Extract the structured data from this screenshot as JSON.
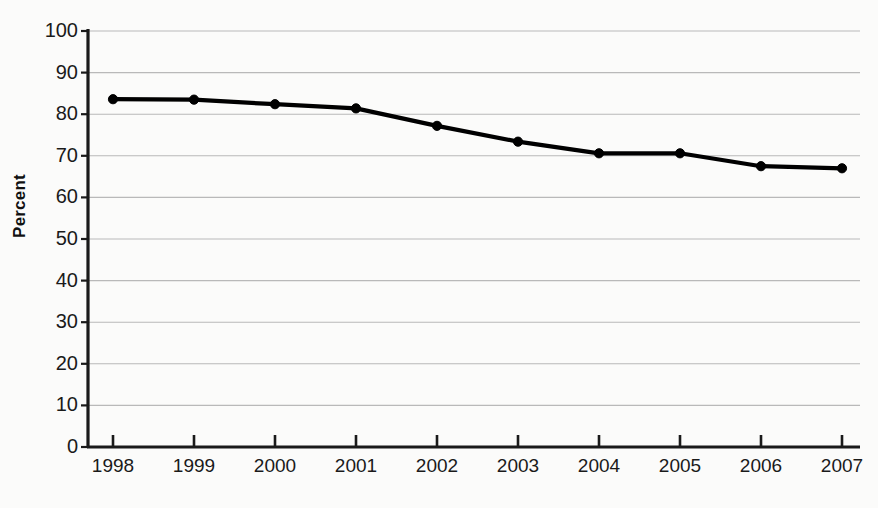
{
  "chart_data": {
    "type": "line",
    "title": "",
    "xlabel": "",
    "ylabel": "Percent",
    "categories": [
      "1998",
      "1999",
      "2000",
      "2001",
      "2002",
      "2003",
      "2004",
      "2005",
      "2006",
      "2007"
    ],
    "values": [
      83.6,
      83.5,
      82.4,
      81.4,
      77.2,
      73.4,
      70.6,
      70.6,
      67.5,
      67.0
    ],
    "ylim": [
      0,
      100
    ],
    "ytick_labels": [
      "0",
      "10",
      "20",
      "30",
      "40",
      "50",
      "60",
      "70",
      "80",
      "90",
      "100"
    ],
    "ytick_values": [
      0,
      10,
      20,
      30,
      40,
      50,
      60,
      70,
      80,
      90,
      100
    ],
    "grid": true,
    "legend": "none",
    "series_color": "#000000",
    "grid_color": "#b9b9b9",
    "axis_color": "#1a1a1a",
    "background_color": "#fbfbfa",
    "marker": "circle"
  }
}
